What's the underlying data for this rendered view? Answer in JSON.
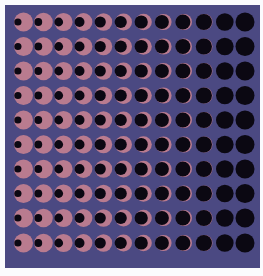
{
  "figure": {
    "background_color": "#4b4982",
    "page_color": "#fbfbfd",
    "pink_color": "#b97b8f",
    "dark_color": "#0b0812",
    "rows": 10,
    "columns": 12,
    "column_centers_x": [
      23.5,
      43.5,
      63.5,
      83.5,
      103.5,
      123.5,
      143.5,
      163.5,
      184,
      204.5,
      225,
      245
    ],
    "row_centers_y": [
      22,
      46.5,
      71,
      95.5,
      120,
      144.5,
      169,
      193.5,
      218,
      243
    ],
    "pink_radius": [
      9.5,
      9.3,
      9.1,
      8.9,
      8.7,
      8.5,
      8.3,
      8.1,
      8.0,
      8.0,
      8.0,
      8.0
    ],
    "dark_radius": [
      3.6,
      3.9,
      4.4,
      5.0,
      5.6,
      6.1,
      6.6,
      7.0,
      7.5,
      8.1,
      8.8,
      9.5
    ],
    "dark_offset_x": [
      -5.6,
      -5.2,
      -4.8,
      -4.0,
      -3.3,
      -2.8,
      -2.3,
      -1.6,
      -1.1,
      -0.6,
      -0.2,
      0
    ]
  }
}
